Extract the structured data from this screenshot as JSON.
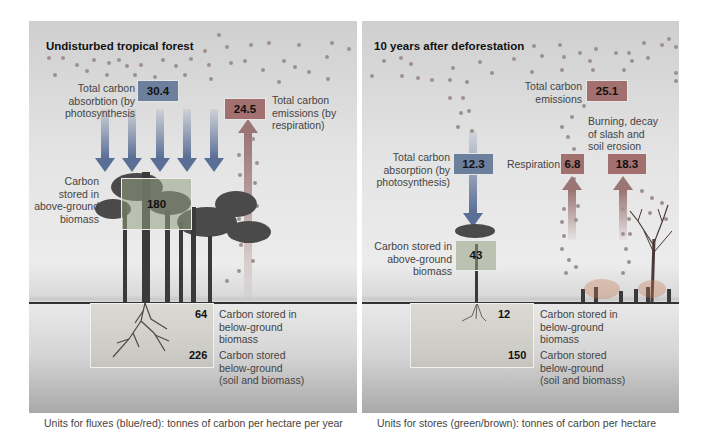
{
  "left_panel": {
    "title": "Undisturbed tropical forest",
    "absorption": {
      "label_lines": [
        "Total carbon",
        "absorbtion (by",
        "photosynthesis"
      ],
      "value": "30.4"
    },
    "emissions": {
      "label_lines": [
        "Total carbon",
        "emissions (by",
        "respiration)"
      ],
      "value": "24.5"
    },
    "above_ground": {
      "label_lines": [
        "Carbon",
        "stored in",
        "above-ground",
        "biomass"
      ],
      "value": "180"
    },
    "below_ground_biomass": {
      "label_lines": [
        "Carbon stored in",
        "below-ground",
        "biomass"
      ],
      "value": "64"
    },
    "below_ground_total": {
      "label_lines": [
        "Carbon stored",
        "below-ground",
        "(soil and biomass)"
      ],
      "value": "226"
    },
    "caption": "Units for fluxes (blue/red): tonnes of carbon per hectare per year"
  },
  "right_panel": {
    "title": "10 years after deforestation",
    "emissions": {
      "label_lines": [
        "Total carbon",
        "emissions"
      ],
      "value": "25.1"
    },
    "burning": {
      "label_lines": [
        "Burning, decay",
        "of slash and",
        "soil erosion"
      ],
      "value": "18.3"
    },
    "respiration": {
      "label": "Respiration",
      "value": "6.8"
    },
    "absorption": {
      "label_lines": [
        "Total carbon",
        "absorption (by",
        "photosynthesis)"
      ],
      "value": "12.3"
    },
    "above_ground": {
      "label_lines": [
        "Carbon stored in",
        "above-ground",
        "biomass"
      ],
      "value": "43"
    },
    "below_ground_biomass": {
      "label_lines": [
        "Carbon stored in",
        "below-ground",
        "biomass"
      ],
      "value": "12"
    },
    "below_ground_total": {
      "label_lines": [
        "Carbon stored",
        "below-ground",
        "(soil and biomass)"
      ],
      "value": "150"
    },
    "caption": "Units for stores (green/brown): tonnes of carbon per hectare"
  },
  "colors": {
    "absorption_flux": "#5a6e96",
    "emission_flux": "#9b7474",
    "store_above": "#96a082",
    "store_below": "#b4aa96"
  }
}
